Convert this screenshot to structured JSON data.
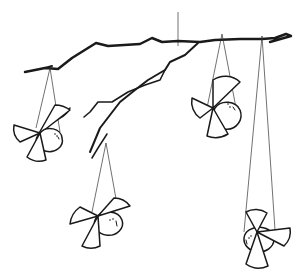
{
  "scene": {
    "description": "Hand-drawn line illustration of a tree branch mobile with four hanging paper birds",
    "colors": {
      "ink": "#1a1a1a",
      "background": "#ffffff",
      "string": "#333333"
    },
    "elements": {
      "branch": "tree-branch",
      "top_string": "hanging-string",
      "birds": [
        {
          "name": "bird-left",
          "position": "upper-left"
        },
        {
          "name": "bird-center-right",
          "position": "upper-middle-right"
        },
        {
          "name": "bird-bottom-center",
          "position": "lower-center"
        },
        {
          "name": "bird-bottom-right",
          "position": "lower-right"
        }
      ]
    }
  }
}
